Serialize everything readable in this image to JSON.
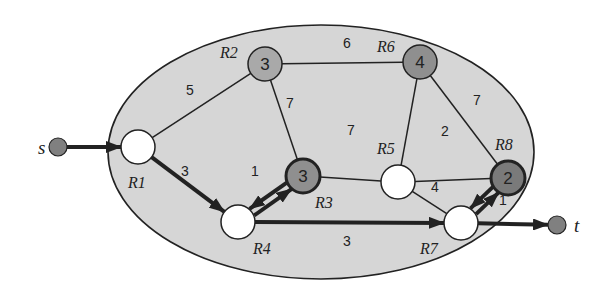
{
  "colors": {
    "region_fill": "#d6d6d6",
    "region_stroke": "#222222",
    "edge": "#222222",
    "node_white": "#ffffff",
    "node_light": "#a9a9a9",
    "node_mid": "#8f8f8f",
    "node_dark": "#7a7a7a",
    "endpoint": "#808080"
  },
  "endpoints": [
    {
      "id": "s",
      "label": "s",
      "x": 58,
      "y": 147,
      "label_x": 38,
      "label_y": 154
    },
    {
      "id": "t",
      "label": "t",
      "x": 557,
      "y": 225,
      "label_x": 574,
      "label_y": 232
    }
  ],
  "routers": [
    {
      "id": "R1",
      "label": "R1",
      "value": "",
      "x": 138,
      "y": 147,
      "fill": "node_white",
      "thick": false,
      "label_x": 128,
      "label_y": 188
    },
    {
      "id": "R2",
      "label": "R2",
      "value": "3",
      "x": 265,
      "y": 64,
      "fill": "node_light",
      "thick": false,
      "label_x": 220,
      "label_y": 58
    },
    {
      "id": "R3",
      "label": "R3",
      "value": "3",
      "x": 303,
      "y": 176,
      "fill": "node_mid",
      "thick": true,
      "label_x": 315,
      "label_y": 208
    },
    {
      "id": "R4",
      "label": "R4",
      "value": "",
      "x": 238,
      "y": 222,
      "fill": "node_white",
      "thick": false,
      "label_x": 253,
      "label_y": 254
    },
    {
      "id": "R5",
      "label": "R5",
      "value": "",
      "x": 398,
      "y": 182,
      "fill": "node_white",
      "thick": false,
      "label_x": 377,
      "label_y": 154
    },
    {
      "id": "R6",
      "label": "R6",
      "value": "4",
      "x": 420,
      "y": 62,
      "fill": "node_mid",
      "thick": false,
      "label_x": 377,
      "label_y": 52
    },
    {
      "id": "R7",
      "label": "R7",
      "value": "",
      "x": 461,
      "y": 223,
      "fill": "node_white",
      "thick": false,
      "label_x": 420,
      "label_y": 254
    },
    {
      "id": "R8",
      "label": "R8",
      "value": "2",
      "x": 508,
      "y": 178,
      "fill": "node_dark",
      "thick": true,
      "label_x": 495,
      "label_y": 150
    }
  ],
  "edges": [
    {
      "from": "R1",
      "to": "R2",
      "weight": "5",
      "wx": 190,
      "wy": 95
    },
    {
      "from": "R2",
      "to": "R6",
      "weight": "6",
      "wx": 347,
      "wy": 48
    },
    {
      "from": "R2",
      "to": "R3",
      "weight": "7",
      "wx": 290,
      "wy": 108
    },
    {
      "from": "R3",
      "to": "R5",
      "weight": "7",
      "wx": 351,
      "wy": 135
    },
    {
      "from": "R6",
      "to": "R5",
      "weight": "",
      "wx": 0,
      "wy": 0
    },
    {
      "from": "R6",
      "to": "R8",
      "weight": "7",
      "wx": 477,
      "wy": 105
    },
    {
      "from": "R5",
      "to": "R8",
      "weight": "2",
      "wx": 445,
      "wy": 136
    },
    {
      "from": "R5",
      "to": "R7",
      "weight": "4",
      "wx": 435,
      "wy": 192
    }
  ],
  "path_edges": [
    {
      "from": "s",
      "to": "R1",
      "weight": "",
      "wx": 0,
      "wy": 0
    },
    {
      "from": "R1",
      "to": "R4",
      "weight": "3",
      "wx": 185,
      "wy": 176
    },
    {
      "from": "R4",
      "to": "R3",
      "weight": "1",
      "wx": 255,
      "wy": 176
    },
    {
      "from": "R3",
      "to": "R4",
      "weight": "",
      "wx": 0,
      "wy": 0
    },
    {
      "from": "R4",
      "to": "R7",
      "weight": "3",
      "wx": 347,
      "wy": 246
    },
    {
      "from": "R7",
      "to": "R8",
      "weight": "",
      "wx": 0,
      "wy": 0
    },
    {
      "from": "R8",
      "to": "R7",
      "weight": "1",
      "wx": 503,
      "wy": 205
    },
    {
      "from": "R7",
      "to": "t",
      "weight": "",
      "wx": 0,
      "wy": 0
    }
  ]
}
